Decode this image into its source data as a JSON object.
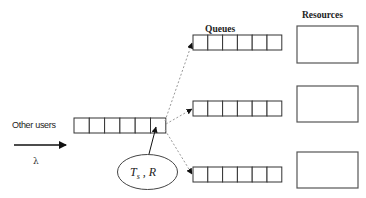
{
  "diagram": {
    "labels": {
      "queues": "Queues",
      "resources": "Resources",
      "other_users": "Other users",
      "arrival_rate": "λ",
      "params_T": "T",
      "params_sub": "s",
      "params_rest": " , R"
    },
    "source_queue": {
      "cells": 6,
      "x": 74,
      "y": 118,
      "cell_w": 15.3,
      "h": 15
    },
    "dest_queues": [
      {
        "name": "queue-1",
        "cells": 6,
        "x": 193,
        "y": 35,
        "cell_w": 14.8,
        "h": 15
      },
      {
        "name": "queue-2",
        "cells": 6,
        "x": 193,
        "y": 101,
        "cell_w": 14.8,
        "h": 15
      },
      {
        "name": "queue-3",
        "cells": 6,
        "x": 193,
        "y": 167,
        "cell_w": 14.8,
        "h": 15
      }
    ],
    "resources": [
      {
        "name": "resource-1",
        "x": 297,
        "y": 26,
        "w": 61,
        "h": 37
      },
      {
        "name": "resource-2",
        "x": 297,
        "y": 86,
        "w": 61,
        "h": 36
      },
      {
        "name": "resource-3",
        "x": 297,
        "y": 152,
        "w": 61,
        "h": 36
      }
    ],
    "colors": {
      "stroke": "#333333",
      "dashed": "#999999",
      "background": "#ffffff"
    }
  }
}
